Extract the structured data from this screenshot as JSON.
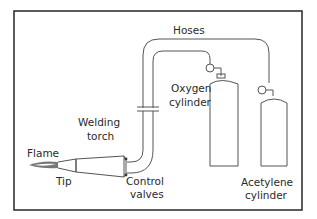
{
  "diagram": {
    "labels": {
      "hoses": "Hoses",
      "oxygen_1": "Oxygen",
      "oxygen_2": "cylinder",
      "acetylene_1": "Acetylene",
      "acetylene_2": "cylinder",
      "welding_1": "Welding",
      "welding_2": "torch",
      "flame": "Flame",
      "tip": "Tip",
      "control_1": "Control",
      "control_2": "valves"
    },
    "components": [
      "Flame",
      "Tip",
      "Welding torch",
      "Control valves",
      "Hoses",
      "Oxygen cylinder",
      "Acetylene cylinder"
    ],
    "colors": {
      "line": "#555555",
      "frame": "#333333",
      "text": "#2a2a2a",
      "background": "#ffffff"
    }
  }
}
